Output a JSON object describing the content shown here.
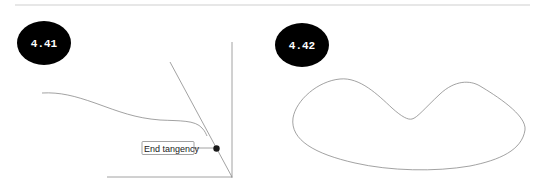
{
  "figures": [
    {
      "id_label": "4.41",
      "callout": "End tangency"
    },
    {
      "id_label": "4.42"
    }
  ],
  "colors": {
    "badge_fill": "#000000",
    "badge_text": "#ffffff",
    "line": "#8a8a8a",
    "rule": "#cfcfcf",
    "dot": "#1a1a1a"
  }
}
